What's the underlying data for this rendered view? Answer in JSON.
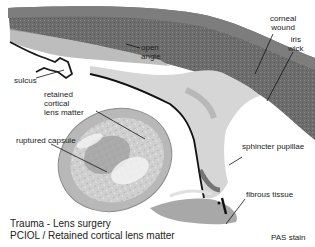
{
  "figure": {
    "type": "histology micrograph",
    "stain": "PAS stain",
    "caption": {
      "line1": "Trauma - Lens surgery",
      "line2": "PCIOL / Retained cortical lens matter"
    },
    "labels": {
      "corneal_wound": [
        "corneal",
        "wound"
      ],
      "iris_wick": [
        "iris",
        "wick"
      ],
      "open_angle": [
        "open",
        "angle"
      ],
      "sulcus": "sulcus",
      "retained_cortical": [
        "retained",
        "cortical",
        "lens matter"
      ],
      "ruptured_capsule": "ruptured capsule",
      "sphincter_pupillae": "sphincter pupillae",
      "fibrous_tissue": "fibrous tissue"
    },
    "colors": {
      "cornea": "#6f6f6f",
      "cornea_dark": "#555555",
      "iris_tissue": "#cfcfcf",
      "pigment": "#111111",
      "lens_capsule": "#a9a9a9",
      "lens_cortex": "#d8d8d8",
      "lens_dark": "#8a8a8a",
      "background": "#ffffff"
    }
  }
}
